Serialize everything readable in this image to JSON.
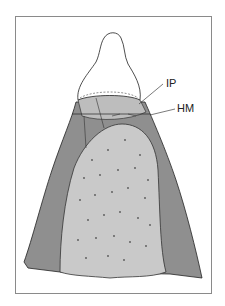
{
  "figure": {
    "type": "dental cross-section illustration",
    "labels": [
      {
        "id": "ip",
        "text": "IP"
      },
      {
        "id": "hm",
        "text": "HM"
      }
    ],
    "colors": {
      "soft_tissue": "#8f8f8f",
      "bone": "#c9c9c9",
      "crown_fill": "#ffffff",
      "outline": "#2a2a2a",
      "frame": "#8a8a8a"
    }
  }
}
